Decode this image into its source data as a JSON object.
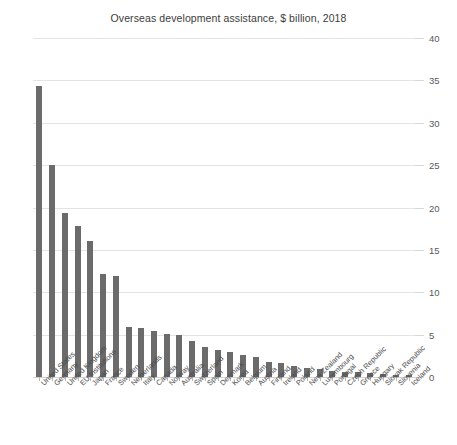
{
  "chart_data": {
    "type": "bar",
    "title": "Overseas development assistance, $ billion, 2018",
    "xlabel": "",
    "ylabel": "",
    "ylim": [
      0,
      40
    ],
    "yticks": [
      0,
      5,
      10,
      15,
      20,
      25,
      30,
      35,
      40
    ],
    "grid": true,
    "legend": "none",
    "y_axis_position": "right",
    "bar_color": "#6b6b6b",
    "gridline_color": "#e4e4e4",
    "categories": [
      "United States",
      "Germany",
      "United Kingdom",
      "EU Institutions",
      "Japan",
      "France",
      "Sweden",
      "Netherlands",
      "Italy",
      "Canada",
      "Norway",
      "Australia",
      "Switzerland",
      "Spain",
      "Denmark",
      "Korea",
      "Belgium",
      "Austria",
      "Finland",
      "Ireland",
      "Poland",
      "New Zealand",
      "Luxembourg",
      "Portugal",
      "Czech Republic",
      "Greece",
      "Hungary",
      "Slovak Republic",
      "Slovenia",
      "Iceland"
    ],
    "values": [
      34.3,
      25.0,
      19.4,
      17.8,
      16.1,
      12.2,
      11.9,
      5.9,
      5.8,
      5.4,
      5.1,
      4.9,
      4.2,
      3.5,
      3.2,
      2.9,
      2.6,
      2.4,
      1.8,
      1.6,
      1.3,
      1.1,
      0.9,
      0.75,
      0.65,
      0.55,
      0.45,
      0.35,
      0.28,
      0.18
    ]
  }
}
